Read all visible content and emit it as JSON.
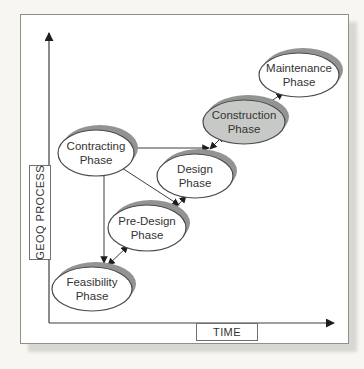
{
  "diagram": {
    "y_axis_label": "GEOQ PROCESS",
    "x_axis_label": "TIME",
    "nodes": {
      "feasibility": {
        "line1": "Feasibility",
        "line2": "Phase",
        "highlighted": false
      },
      "predesign": {
        "line1": "Pre-Design",
        "line2": "Phase",
        "highlighted": false
      },
      "contracting": {
        "line1": "Contracting",
        "line2": "Phase",
        "highlighted": false
      },
      "design": {
        "line1": "Design",
        "line2": "Phase",
        "highlighted": false
      },
      "construction": {
        "line1": "Construction",
        "line2": "Phase",
        "highlighted": true
      },
      "maintenance": {
        "line1": "Maintenance",
        "line2": "Phase",
        "highlighted": false
      }
    },
    "edges": [
      {
        "from": "contracting",
        "to": "feasibility",
        "arrows": "end"
      },
      {
        "from": "feasibility",
        "to": "predesign",
        "arrows": "both"
      },
      {
        "from": "contracting",
        "to": "predesign-design-junction",
        "arrows": "end"
      },
      {
        "from": "predesign",
        "to": "design",
        "arrows": "both"
      },
      {
        "from": "contracting",
        "to": "design-construction-junction",
        "arrows": "end"
      },
      {
        "from": "design",
        "to": "construction",
        "arrows": "both"
      },
      {
        "from": "construction",
        "to": "maintenance",
        "arrows": "end"
      }
    ],
    "colors": {
      "node_fill": "#ffffff",
      "highlight_fill": "#c7c9c6",
      "node_shadow": "#929494",
      "stroke": "#4a4a4a",
      "figure_border": "#8f8f8f",
      "page_background": "#f7f6f1"
    }
  }
}
